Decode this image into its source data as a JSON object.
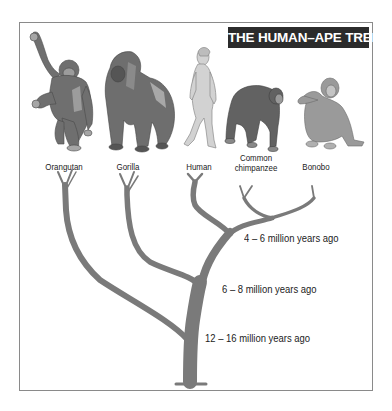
{
  "title": "THE HUMAN–APE TREE",
  "colors": {
    "title_bg": "#2b2b2b",
    "title_text": "#ffffff",
    "tree": "#7a7a7a",
    "frame_border": "#8a8a8a",
    "label_text": "#222222"
  },
  "species": [
    {
      "name": "Orangutan",
      "line1": "Orangutan",
      "line2": ""
    },
    {
      "name": "Gorilla",
      "line1": "Gorilla",
      "line2": ""
    },
    {
      "name": "Human",
      "line1": "Human",
      "line2": ""
    },
    {
      "name": "Common chimpanzee",
      "line1": "Common",
      "line2": "chimpanzee"
    },
    {
      "name": "Bonobo",
      "line1": "Bonobo",
      "line2": ""
    }
  ],
  "divergences": [
    {
      "label": "4 – 6 million years ago",
      "splits": "Human from chimpanzee/bonobo"
    },
    {
      "label": "6 – 8 million years ago",
      "splits": "Gorilla from human/chimp lineage"
    },
    {
      "label": "12 – 16 million years ago",
      "splits": "Orangutan from African apes"
    }
  ]
}
